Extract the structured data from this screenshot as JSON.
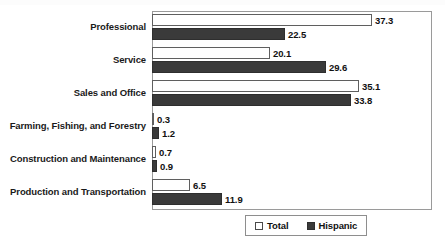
{
  "chart_data": {
    "type": "bar",
    "orientation": "horizontal",
    "title": "",
    "xlabel": "",
    "ylabel": "",
    "grid": false,
    "xlim": [
      0,
      47.5
    ],
    "legend_position": "bottom",
    "categories": [
      "Professional",
      "Service",
      "Sales and Office",
      "Farming, Fishing, and Forestry",
      "Construction and Maintenance",
      "Production and Transportation"
    ],
    "series": [
      {
        "name": "Total",
        "color": "#ffffff",
        "values": [
          37.3,
          20.1,
          35.1,
          0.3,
          0.7,
          6.5
        ],
        "labels": [
          "37.3",
          "20.1",
          "35.1",
          "0.3",
          "0.7",
          "6.5"
        ]
      },
      {
        "name": "Hispanic",
        "color": "#3a3a3a",
        "values": [
          22.5,
          29.6,
          33.8,
          1.2,
          0.9,
          11.9
        ],
        "labels": [
          "22.5",
          "29.6",
          "33.8",
          "1.2",
          "0.9",
          "11.9"
        ]
      }
    ]
  },
  "legend": {
    "items": [
      {
        "label": "Total",
        "swatch": "hollow-square-icon"
      },
      {
        "label": "Hispanic",
        "swatch": "filled-square-icon"
      }
    ]
  }
}
